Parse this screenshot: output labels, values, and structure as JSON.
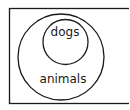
{
  "diagram": {
    "type": "venn-euler",
    "stroke_color": "#1a1a1a",
    "background": "#ffffff",
    "universe": {
      "label": ""
    },
    "sets": [
      {
        "id": "animals",
        "label": "animals"
      },
      {
        "id": "dogs",
        "label": "dogs",
        "subset_of": "animals"
      }
    ]
  }
}
